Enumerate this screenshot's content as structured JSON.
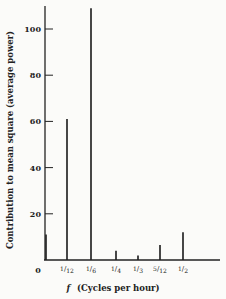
{
  "chart_data": {
    "type": "bar",
    "title": "",
    "xlabel": "f (Cycles per hour)",
    "xlabel_italic_part": "f",
    "xlabel_rest": "(Cycles per hour)",
    "ylabel": "Contribution to mean square (average power)",
    "ylim": [
      0,
      110
    ],
    "yticks": [
      20,
      40,
      60,
      80,
      100
    ],
    "grid": false,
    "legend": null,
    "categories": [
      "0",
      "1/12",
      "1/6",
      "1/4",
      "1/3",
      "5/12",
      "1/2"
    ],
    "values": [
      11,
      61,
      109,
      4,
      2,
      6.5,
      12
    ],
    "x_origin_label": "0"
  }
}
